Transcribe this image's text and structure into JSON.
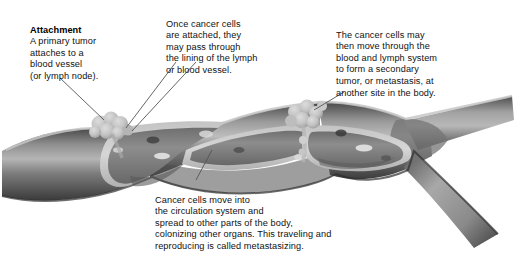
{
  "diagram": {
    "palette": {
      "background": "#ffffff",
      "vessel_outer_dark": "#3f3f3f",
      "vessel_outer_mid": "#6e6e6e",
      "vessel_highlight": "#b9b9b9",
      "vessel_wall_light": "#cfcfcf",
      "lumen": "#8a8a8a",
      "lumen_shadow": "#5a5a5a",
      "tumor": "#c8c8c8",
      "tumor_shade": "#9a9a9a",
      "cell": "#e2e2e2",
      "leader_line": "#555555",
      "text": "#111111"
    },
    "notes": [
      {
        "id": "attachment",
        "heading": "Attachment",
        "body": "A primary tumor\nattaches to a\nblood vessel\n(or lymph node)."
      },
      {
        "id": "lining",
        "heading": "",
        "body": "Once cancer cells\nare attached, they\nmay pass through\nthe lining of the lymph\nor blood vessel."
      },
      {
        "id": "secondary",
        "heading": "",
        "body": "The cancer cells may\nthen move through the\nblood and lymph system\nto form a secondary\ntumor, or metastasis, at\nanother site in the body."
      },
      {
        "id": "circulation",
        "heading": "",
        "body": "Cancer cells move into\nthe circulation system and\nspread to other parts of the body,\ncolonizing other organs. This traveling and\nreproducing is called metastasizing."
      }
    ],
    "parts": [
      {
        "id": "primary-tumor",
        "label": "primary tumor cluster attached to vessel wall"
      },
      {
        "id": "secondary-tumor",
        "label": "secondary tumor cluster with invading cells"
      },
      {
        "id": "vessel",
        "label": "blood or lymph vessel, cut away"
      },
      {
        "id": "vessel-branch",
        "label": "vessel bifurcation"
      },
      {
        "id": "free-cells",
        "label": "cancer cells travelling in the lumen"
      }
    ]
  }
}
